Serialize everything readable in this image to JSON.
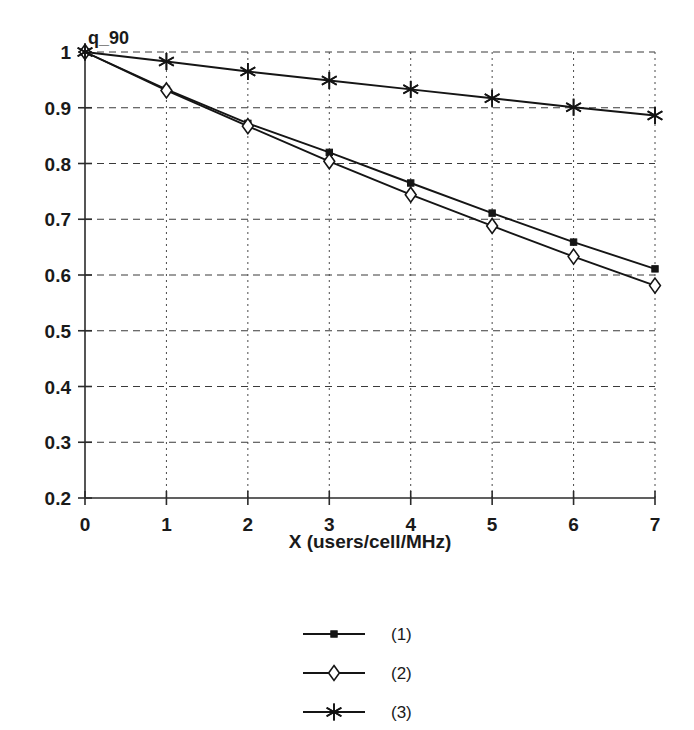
{
  "chart_data": {
    "type": "line",
    "title": "",
    "subtitle": "",
    "xlabel": "X (users/cell/MHz)",
    "ylabel": "q_90",
    "x": [
      0,
      1,
      2,
      3,
      4,
      5,
      6,
      7
    ],
    "xlim": [
      0,
      7
    ],
    "ylim": [
      0.2,
      1.0
    ],
    "xticks": [
      "0",
      "1",
      "2",
      "3",
      "4",
      "5",
      "6",
      "7"
    ],
    "yticks": [
      "0.2",
      "0.3",
      "0.4",
      "0.5",
      "0.6",
      "0.7",
      "0.8",
      "0.9",
      "1"
    ],
    "ytick_values": [
      0.2,
      0.3,
      0.4,
      0.5,
      0.6,
      0.7,
      0.8,
      0.9,
      1.0
    ],
    "grid": true,
    "grid_horizontal_style": "dashed",
    "grid_vertical_style": "dotted",
    "legend_position": "below-center",
    "series": [
      {
        "name": "(1)",
        "marker": "filled-square",
        "values": [
          1.0,
          0.933,
          0.872,
          0.82,
          0.765,
          0.711,
          0.659,
          0.611
        ]
      },
      {
        "name": "(2)",
        "marker": "open-diamond",
        "values": [
          1.0,
          0.931,
          0.867,
          0.804,
          0.744,
          0.688,
          0.633,
          0.581
        ]
      },
      {
        "name": "(3)",
        "marker": "asterisk",
        "values": [
          1.0,
          0.983,
          0.965,
          0.949,
          0.933,
          0.917,
          0.901,
          0.886
        ]
      }
    ],
    "colors": {
      "line": "#151515",
      "grid": "#3a3a3a",
      "axis": "#2b2b2b",
      "background": "#ffffff"
    }
  },
  "legend": {
    "entries": [
      {
        "label": "(1)",
        "marker": "filled-square"
      },
      {
        "label": "(2)",
        "marker": "open-diamond"
      },
      {
        "label": "(3)",
        "marker": "asterisk"
      }
    ]
  },
  "axes": {
    "y_axis_label": "q_90",
    "x_axis_label": "X (users/cell/MHz)"
  }
}
